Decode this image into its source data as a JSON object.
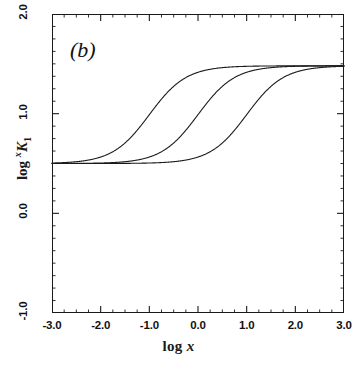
{
  "figure": {
    "panel_label": "(b)"
  },
  "chart_data": {
    "type": "line",
    "title": "",
    "panel": "(b)",
    "xlabel": "log x",
    "ylabel": "log ˣK₁",
    "ylabel_parts": {
      "prefix": "log ",
      "superscript": "x",
      "base": "K",
      "subscript": "1"
    },
    "xlim": [
      -3.0,
      3.0
    ],
    "ylim": [
      -1.0,
      2.0
    ],
    "xticks": [
      -3.0,
      -2.0,
      -1.0,
      0.0,
      1.0,
      2.0,
      3.0
    ],
    "xtick_labels": [
      "-3.0",
      "-2.0",
      "-1.0",
      "0.0",
      "1.0",
      "2.0",
      "3.0"
    ],
    "yticks": [
      -1.0,
      0.0,
      1.0,
      2.0
    ],
    "ytick_labels": [
      "-1.0",
      "0.0",
      "1.0",
      "2.0"
    ],
    "x_minor_tick_step": 0.25,
    "y_minor_tick_step": 0.125,
    "grid": false,
    "legend": null,
    "baseline": 0.5,
    "plateau": 1.48,
    "line_color": "#1a1a1a",
    "line_width": 1.1,
    "series": [
      {
        "name": "curve-left",
        "midpoint": -1.0,
        "slope": 1.15,
        "x": [
          -3.0,
          -2.75,
          -2.5,
          -2.25,
          -2.0,
          -1.75,
          -1.5,
          -1.25,
          -1.0,
          -0.75,
          -0.5,
          -0.25,
          0.0,
          0.25,
          0.5,
          0.75,
          1.0,
          1.25,
          1.5,
          1.75,
          2.0,
          2.25,
          2.5,
          2.75,
          3.0
        ],
        "y": [
          0.506,
          0.509,
          0.514,
          0.522,
          0.535,
          0.556,
          0.59,
          0.64,
          0.713,
          0.808,
          0.918,
          1.03,
          1.131,
          1.214,
          1.277,
          1.323,
          1.355,
          1.378,
          1.393,
          1.404,
          1.411,
          1.416,
          1.42,
          1.423,
          1.425
        ]
      },
      {
        "name": "curve-middle",
        "midpoint": 0.0,
        "slope": 1.15,
        "x": [
          -3.0,
          -2.75,
          -2.5,
          -2.25,
          -2.0,
          -1.75,
          -1.5,
          -1.25,
          -1.0,
          -0.75,
          -0.5,
          -0.25,
          0.0,
          0.25,
          0.5,
          0.75,
          1.0,
          1.25,
          1.5,
          1.75,
          2.0,
          2.25,
          2.5,
          2.75,
          3.0
        ],
        "y": [
          0.5,
          0.501,
          0.502,
          0.503,
          0.506,
          0.509,
          0.514,
          0.522,
          0.535,
          0.556,
          0.59,
          0.64,
          0.713,
          0.808,
          0.918,
          1.03,
          1.131,
          1.214,
          1.277,
          1.323,
          1.355,
          1.378,
          1.393,
          1.404,
          1.411
        ]
      },
      {
        "name": "curve-right",
        "midpoint": 1.0,
        "slope": 1.15,
        "x": [
          -3.0,
          -2.75,
          -2.5,
          -2.25,
          -2.0,
          -1.75,
          -1.5,
          -1.25,
          -1.0,
          -0.75,
          -0.5,
          -0.25,
          0.0,
          0.25,
          0.5,
          0.75,
          1.0,
          1.25,
          1.5,
          1.75,
          2.0,
          2.25,
          2.5,
          2.75,
          3.0
        ],
        "y": [
          0.5,
          0.5,
          0.5,
          0.5,
          0.5,
          0.501,
          0.502,
          0.503,
          0.506,
          0.509,
          0.514,
          0.522,
          0.535,
          0.556,
          0.59,
          0.64,
          0.713,
          0.808,
          0.918,
          1.03,
          1.131,
          1.214,
          1.277,
          1.323,
          1.355
        ]
      }
    ]
  }
}
